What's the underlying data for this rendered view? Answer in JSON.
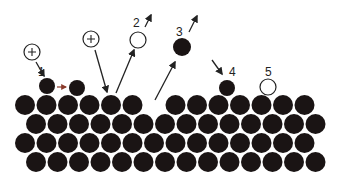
{
  "diagram": {
    "colors": {
      "atom": "#1a1414",
      "ion_stroke": "#222222",
      "arrow": "#222222",
      "migration_arrow": "#8a3a2a",
      "background": "#ffffff"
    },
    "lattice": {
      "atom_radius": 10,
      "rows": [
        {
          "y": 105,
          "x": [
            25,
            46.5,
            68,
            89.5,
            111,
            132.5,
            175.5,
            197,
            218.5,
            240,
            261.5,
            283,
            304.5
          ]
        },
        {
          "y": 124,
          "x": [
            36,
            57.5,
            79,
            100.5,
            122,
            143.5,
            165,
            186.5,
            208,
            229.5,
            251,
            272.5,
            294,
            315.5
          ]
        },
        {
          "y": 143,
          "x": [
            25,
            46.5,
            68,
            89.5,
            111,
            132.5,
            154,
            175.5,
            197,
            218.5,
            240,
            261.5,
            283,
            304.5
          ]
        },
        {
          "y": 162,
          "x": [
            36,
            57.5,
            79,
            100.5,
            122,
            143.5,
            165,
            186.5,
            208,
            229.5,
            251,
            272.5,
            294,
            315.5
          ]
        }
      ]
    },
    "processes": [
      {
        "id": "1",
        "label": "1",
        "label_pos": [
          38,
          75
        ],
        "description": "incident ion causes adatom migration"
      },
      {
        "id": "2",
        "label": "2",
        "label_pos": [
          133,
          26
        ],
        "description": "sputtered ion"
      },
      {
        "id": "3",
        "label": "3",
        "label_pos": [
          176,
          36
        ],
        "description": "sputtered neutral atom"
      },
      {
        "id": "4",
        "label": "4",
        "label_pos": [
          230,
          77
        ],
        "description": "deposited adatom"
      },
      {
        "id": "5",
        "label": "5",
        "label_pos": [
          266,
          77
        ],
        "description": "surface ion / vacancy"
      }
    ],
    "ions": [
      {
        "name": "incident-ion-1",
        "cx": 32,
        "cy": 52,
        "r": 8,
        "symbol": "+"
      },
      {
        "name": "incident-ion-2",
        "cx": 91,
        "cy": 39,
        "r": 8,
        "symbol": "+"
      }
    ],
    "open_circles": [
      {
        "name": "sputtered-ion-2",
        "cx": 138,
        "cy": 40,
        "r": 8
      },
      {
        "name": "surface-ion-5",
        "cx": 268,
        "cy": 87,
        "r": 8
      }
    ],
    "adatoms": [
      {
        "name": "adatom-1-origin",
        "cx": 47,
        "cy": 86,
        "r": 8
      },
      {
        "name": "adatom-1-destination",
        "cx": 77,
        "cy": 88,
        "r": 8
      },
      {
        "name": "sputtered-atom-3",
        "cx": 182,
        "cy": 47,
        "r": 9
      },
      {
        "name": "adatom-4",
        "cx": 227,
        "cy": 88,
        "r": 8
      }
    ]
  }
}
